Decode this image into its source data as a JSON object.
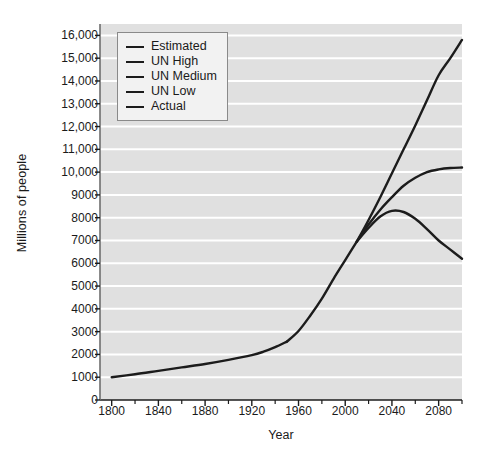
{
  "chart_data": {
    "type": "line",
    "title": "",
    "xlabel": "Year",
    "ylabel": "Millions of people",
    "xlim": [
      1790,
      2100
    ],
    "ylim": [
      0,
      16500
    ],
    "grid": true,
    "legend_position": "top-left",
    "xticks": [
      1800,
      1840,
      1880,
      1920,
      1960,
      2000,
      2040,
      2080
    ],
    "xtick_labels": [
      "1800",
      "1840",
      "1880",
      "1920",
      "1960",
      "2000",
      "2040",
      "2080"
    ],
    "x_minor_ticks": [
      1820,
      1860,
      1900,
      1940,
      1980,
      2020,
      2060,
      2100
    ],
    "yticks": [
      0,
      1000,
      2000,
      3000,
      4000,
      5000,
      6000,
      7000,
      8000,
      9000,
      10000,
      11000,
      12000,
      13000,
      14000,
      15000,
      16000
    ],
    "ytick_labels": [
      "0",
      "1000",
      "2000",
      "3000",
      "4000",
      "5000",
      "6000",
      "7000",
      "8000",
      "9000",
      "10,000",
      "11,000",
      "12,000",
      "13,000",
      "14,000",
      "15,000",
      "16,000"
    ],
    "line_color": "#1c1c1c",
    "plot_background": "#e0e0e0",
    "gridline_color": "#ffffff",
    "series": [
      {
        "name": "Estimated",
        "x": [
          1800,
          1820,
          1840,
          1860,
          1880,
          1900,
          1920,
          1930,
          1940,
          1950
        ],
        "values": [
          1000,
          1130,
          1280,
          1430,
          1580,
          1760,
          1970,
          2120,
          2320,
          2560
        ]
      },
      {
        "name": "Actual",
        "x": [
          1950,
          1960,
          1970,
          1980,
          1990,
          2000,
          2010
        ],
        "values": [
          2560,
          3030,
          3700,
          4450,
          5320,
          6140,
          6960
        ]
      },
      {
        "name": "UN High",
        "x": [
          2010,
          2020,
          2030,
          2040,
          2050,
          2060,
          2070,
          2080,
          2090,
          2100
        ],
        "values": [
          6960,
          7900,
          8900,
          9950,
          11000,
          12050,
          13150,
          14250,
          15000,
          15800
        ]
      },
      {
        "name": "UN Medium",
        "x": [
          2010,
          2020,
          2030,
          2040,
          2050,
          2060,
          2070,
          2080,
          2090,
          2100
        ],
        "values": [
          6960,
          7700,
          8350,
          8900,
          9400,
          9750,
          10000,
          10120,
          10180,
          10200
        ]
      },
      {
        "name": "UN Low",
        "x": [
          2010,
          2020,
          2030,
          2040,
          2050,
          2060,
          2070,
          2080,
          2090,
          2100
        ],
        "values": [
          6960,
          7550,
          8050,
          8300,
          8250,
          7950,
          7500,
          7000,
          6600,
          6200
        ]
      }
    ]
  },
  "legend": {
    "items": [
      {
        "label": "Estimated"
      },
      {
        "label": "UN High"
      },
      {
        "label": "UN Medium"
      },
      {
        "label": "UN Low"
      },
      {
        "label": "Actual"
      }
    ]
  }
}
